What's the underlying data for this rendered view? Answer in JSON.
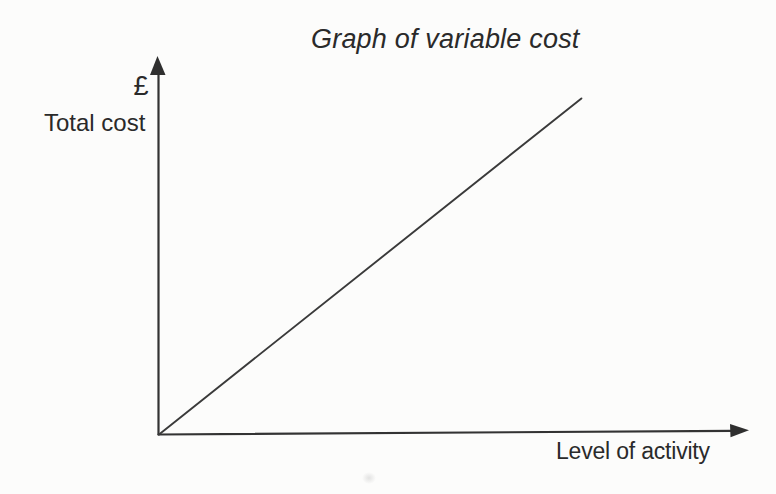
{
  "page": {
    "background": "#fcfcfb",
    "ink_color": "#2c2c2c"
  },
  "chart_data": {
    "type": "line",
    "title": "Graph of variable cost",
    "xlabel": "Level of activity",
    "ylabel": "Total cost",
    "y_unit": "£",
    "x_range": [
      0,
      1
    ],
    "y_range": [
      0,
      1
    ],
    "grid": false,
    "tick_labels": "none",
    "legend_position": "none",
    "axes_style": "arrowed axes meeting at origin, no numeric scale; ranges normalized 0-1",
    "series": [
      {
        "name": "variable-cost-line",
        "description": "straight line rising proportionally from the origin",
        "points": [
          [
            0,
            0
          ],
          [
            0.716,
            0.888
          ]
        ]
      }
    ]
  }
}
